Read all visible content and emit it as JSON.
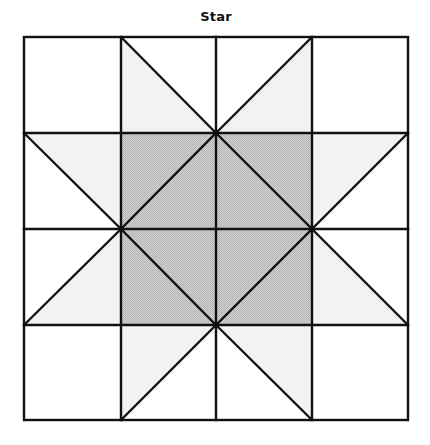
{
  "diagram": {
    "title": "Star",
    "type": "quilt-block",
    "grid": {
      "rows": 4,
      "cols": 4,
      "origin": [
        24,
        37
      ],
      "cell_size": 96
    },
    "colors": {
      "line": "#111111",
      "background": "#ffffff",
      "center_fill": "#c6c6c6",
      "star_point_fill": "#f2f2f2"
    },
    "regions": {
      "corner_squares": [
        {
          "name": "top-left",
          "fill": "white"
        },
        {
          "name": "top-right",
          "fill": "white"
        },
        {
          "name": "bottom-left",
          "fill": "white"
        },
        {
          "name": "bottom-right",
          "fill": "white"
        }
      ],
      "center_square": {
        "cells": "2x2",
        "fill": "gray",
        "inner_shape": "diamond"
      },
      "star_points": [
        {
          "side": "top",
          "count": 2,
          "fill": "light-gray"
        },
        {
          "side": "right",
          "count": 2,
          "fill": "light-gray"
        },
        {
          "side": "bottom",
          "count": 2,
          "fill": "light-gray"
        },
        {
          "side": "left",
          "count": 2,
          "fill": "light-gray"
        }
      ]
    }
  }
}
